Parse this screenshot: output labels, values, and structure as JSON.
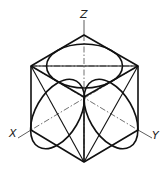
{
  "diagram": {
    "type": "isometric cube with inscribed ellipses",
    "axes": {
      "z_label": "Z",
      "x_label": "X",
      "y_label": "Y"
    },
    "colors": {
      "line": "#111111",
      "background": "#ffffff"
    }
  }
}
